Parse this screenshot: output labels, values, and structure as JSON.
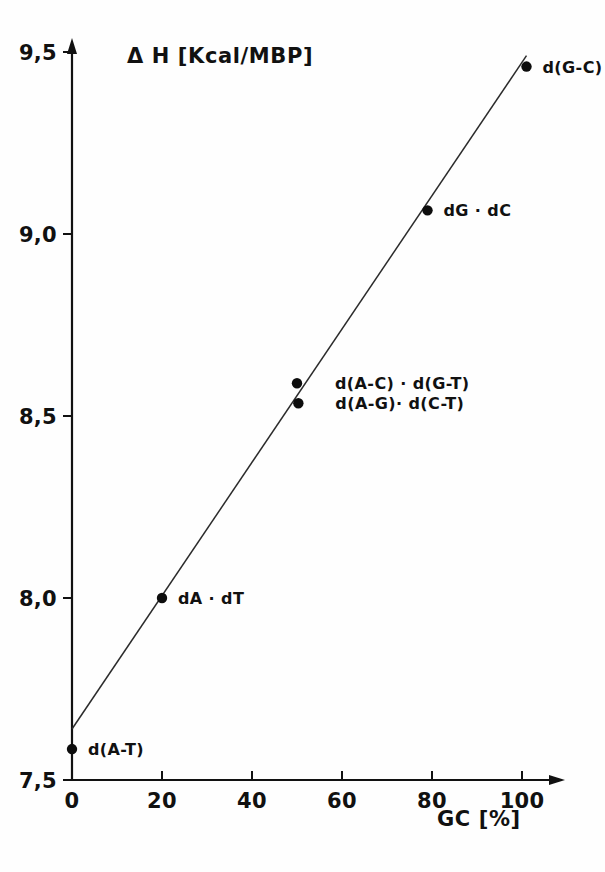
{
  "chart_data": {
    "type": "scatter",
    "title": "",
    "xlabel": "GC  [%]",
    "ylabel": "Δ H  [Kcal/MBP]",
    "xlim": [
      0,
      110
    ],
    "ylim": [
      7.5,
      9.6
    ],
    "grid": false,
    "legend": "none",
    "xticks": [
      0,
      20,
      40,
      60,
      80,
      100
    ],
    "xtick_labels": [
      "0",
      "20",
      "40",
      "60",
      "80",
      "100"
    ],
    "yticks": [
      7.5,
      8.0,
      8.5,
      9.0,
      9.5
    ],
    "ytick_labels": [
      "7,5",
      "8,0",
      "8,5",
      "9,0",
      "9,5"
    ],
    "points": [
      {
        "label": "d(A-T)",
        "x": 0,
        "y": 7.585,
        "label_dx": 16,
        "label_dy": 6
      },
      {
        "label": "dA · dT",
        "x": 20,
        "y": 8.0,
        "label_dx": 16,
        "label_dy": 6
      },
      {
        "label": "d(A-C) · d(G-T)",
        "x": 50,
        "y": 8.59,
        "label_dx": 38,
        "label_dy": 6
      },
      {
        "label": "d(A-G)· d(C-T)",
        "x": 50.3,
        "y": 8.535,
        "label_dx": 37,
        "label_dy": 6
      },
      {
        "label": "dG · dC",
        "x": 79,
        "y": 9.065,
        "label_dx": 16,
        "label_dy": 6
      },
      {
        "label": "d(G-C)",
        "x": 101,
        "y": 9.46,
        "label_dx": 16,
        "label_dy": 6
      }
    ],
    "fit_line": {
      "x_start": 0,
      "y_start": 7.64,
      "x_end": 101,
      "y_end": 9.49
    },
    "colors": {
      "axis": "#111111",
      "line": "#2b2b2b",
      "point": "#0d0d0d",
      "background": "#fefefe"
    }
  },
  "geometry": {
    "origin_x": 72,
    "origin_y": 780,
    "px_per_x_unit": 4.5,
    "px_per_y_unit": 728,
    "y_axis_top": 38,
    "x_axis_right": 565
  }
}
